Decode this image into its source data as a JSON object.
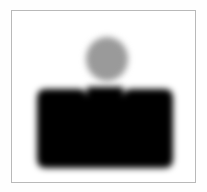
{
  "image": {
    "title": "Pictogram icon",
    "description": "Blurred grayscale pictogram of a person-like figure: a gray circle above a black crenellated block",
    "width": 207,
    "height": 192,
    "outer_background": "#fefefe"
  },
  "panel": {
    "name": "framed-panel",
    "background": "#ffffff",
    "border_color": "#b9b9b9",
    "border_width": 1,
    "x": 11,
    "y": 10,
    "width": 185,
    "height": 173
  },
  "figure": {
    "head": {
      "shape": "circle",
      "color": "#9a9a9a",
      "center_x": 106,
      "center_y": 58,
      "radius_x": 21,
      "radius_y": 22,
      "blur_px": 3.2
    },
    "body": {
      "shape": "crenellated-block",
      "color": "#000000",
      "blur_px": 3.4,
      "left": 36,
      "right": 172,
      "top": 88,
      "bottom": 166,
      "corner_radius": 9,
      "notches": [
        {
          "name": "left-notch",
          "left": 62,
          "right": 86,
          "depth_bottom": 125
        },
        {
          "name": "right-notch",
          "left": 122,
          "right": 146,
          "depth_bottom": 125
        }
      ],
      "center_tooth": {
        "left": 86,
        "right": 122,
        "top": 86
      },
      "path": "M 15 17 Q 15 8 24 8 L 47 8 Q 56 8 56 17 L 56 45 L 56 45 L 56 6 L 92 6 L 92 45 L 92 17 Q 92 8 101 8 L 124 8 Q 133 8 133 17 L 133 77 Q 133 86 124 86 L 24 86 Q 15 86 15 77 Z"
    }
  }
}
